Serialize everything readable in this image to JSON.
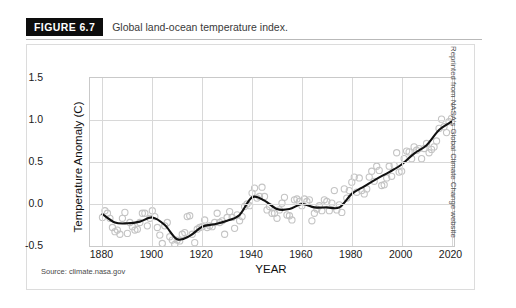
{
  "figure": {
    "badge": "FIGURE 6.7",
    "caption": "Global land-ocean temperature index.",
    "source_note": "Source: climate.nasa.gov",
    "credit": "Reprinted from NASA's Global Climate Change website"
  },
  "colors": {
    "badge_bg": "#0d0d0d",
    "badge_text": "#ffffff",
    "caption_text": "#3a3a3a",
    "gridline": "#d8d8d8",
    "axis": "#c9c9c9",
    "marker_stroke": "#c4c4c4",
    "trend_line": "#111111"
  },
  "chart_data": {
    "type": "scatter",
    "title": "Global land-ocean temperature index.",
    "xlabel": "YEAR",
    "ylabel": "Temperature Anomaly (C)",
    "xlim": [
      1875,
      2021
    ],
    "ylim": [
      -0.5,
      1.5
    ],
    "xticks": [
      1880,
      1900,
      1920,
      1940,
      1960,
      1980,
      2000,
      2020
    ],
    "yticks": [
      -0.5,
      0.0,
      0.5,
      1.0,
      1.5
    ],
    "grid": true,
    "legend": "none",
    "series": [
      {
        "name": "Annual mean",
        "marker": "open-circle",
        "x": [
          1880,
          1881,
          1882,
          1883,
          1884,
          1885,
          1886,
          1887,
          1888,
          1889,
          1890,
          1891,
          1892,
          1893,
          1894,
          1895,
          1896,
          1897,
          1898,
          1899,
          1900,
          1901,
          1902,
          1903,
          1904,
          1905,
          1906,
          1907,
          1908,
          1909,
          1910,
          1911,
          1912,
          1913,
          1914,
          1915,
          1916,
          1917,
          1918,
          1919,
          1920,
          1921,
          1922,
          1923,
          1924,
          1925,
          1926,
          1927,
          1928,
          1929,
          1930,
          1931,
          1932,
          1933,
          1934,
          1935,
          1936,
          1937,
          1938,
          1939,
          1940,
          1941,
          1942,
          1943,
          1944,
          1945,
          1946,
          1947,
          1948,
          1949,
          1950,
          1951,
          1952,
          1953,
          1954,
          1955,
          1956,
          1957,
          1958,
          1959,
          1960,
          1961,
          1962,
          1963,
          1964,
          1965,
          1966,
          1967,
          1968,
          1969,
          1970,
          1971,
          1972,
          1973,
          1974,
          1975,
          1976,
          1977,
          1978,
          1979,
          1980,
          1981,
          1982,
          1983,
          1984,
          1985,
          1986,
          1987,
          1988,
          1989,
          1990,
          1991,
          1992,
          1993,
          1994,
          1995,
          1996,
          1997,
          1998,
          1999,
          2000,
          2001,
          2002,
          2003,
          2004,
          2005,
          2006,
          2007,
          2008,
          2009,
          2010,
          2011,
          2012,
          2013,
          2014,
          2015,
          2016,
          2017,
          2018,
          2019,
          2020
        ],
        "y": [
          -0.16,
          -0.08,
          -0.11,
          -0.17,
          -0.28,
          -0.33,
          -0.31,
          -0.36,
          -0.17,
          -0.1,
          -0.35,
          -0.22,
          -0.27,
          -0.31,
          -0.3,
          -0.22,
          -0.11,
          -0.11,
          -0.26,
          -0.17,
          -0.08,
          -0.15,
          -0.28,
          -0.37,
          -0.47,
          -0.26,
          -0.22,
          -0.39,
          -0.43,
          -0.48,
          -0.43,
          -0.44,
          -0.36,
          -0.34,
          -0.15,
          -0.14,
          -0.36,
          -0.46,
          -0.3,
          -0.28,
          -0.27,
          -0.19,
          -0.28,
          -0.26,
          -0.27,
          -0.22,
          -0.11,
          -0.22,
          -0.2,
          -0.36,
          -0.16,
          -0.09,
          -0.16,
          -0.29,
          -0.13,
          -0.2,
          -0.15,
          -0.03,
          0.0,
          -0.02,
          0.13,
          0.19,
          0.07,
          0.09,
          0.2,
          0.09,
          -0.07,
          -0.03,
          -0.11,
          -0.11,
          -0.17,
          -0.07,
          0.01,
          0.08,
          -0.13,
          -0.14,
          -0.19,
          0.05,
          0.06,
          0.03,
          -0.02,
          0.06,
          0.03,
          0.05,
          -0.2,
          -0.11,
          -0.06,
          -0.02,
          -0.08,
          0.05,
          0.03,
          -0.08,
          0.01,
          0.16,
          -0.07,
          -0.01,
          -0.1,
          0.18,
          0.07,
          0.16,
          0.26,
          0.32,
          0.14,
          0.31,
          0.16,
          0.12,
          0.18,
          0.32,
          0.39,
          0.27,
          0.45,
          0.4,
          0.22,
          0.23,
          0.31,
          0.45,
          0.33,
          0.46,
          0.61,
          0.38,
          0.39,
          0.54,
          0.63,
          0.62,
          0.54,
          0.68,
          0.64,
          0.66,
          0.54,
          0.66,
          0.72,
          0.61,
          0.65,
          0.68,
          0.75,
          0.9,
          1.01,
          0.92,
          0.85,
          0.98,
          1.02
        ]
      },
      {
        "name": "Lowess smoothing",
        "marker": "line",
        "x": [
          1880,
          1885,
          1890,
          1895,
          1900,
          1905,
          1910,
          1915,
          1920,
          1925,
          1930,
          1935,
          1940,
          1945,
          1950,
          1955,
          1960,
          1965,
          1970,
          1975,
          1980,
          1985,
          1990,
          1995,
          2000,
          2005,
          2010,
          2015,
          2020
        ],
        "y": [
          -0.12,
          -0.22,
          -0.23,
          -0.21,
          -0.16,
          -0.25,
          -0.42,
          -0.38,
          -0.27,
          -0.24,
          -0.2,
          -0.13,
          0.08,
          0.04,
          -0.06,
          -0.06,
          0.0,
          -0.04,
          -0.04,
          -0.04,
          0.12,
          0.21,
          0.3,
          0.38,
          0.47,
          0.6,
          0.7,
          0.88,
          0.98
        ]
      }
    ]
  }
}
